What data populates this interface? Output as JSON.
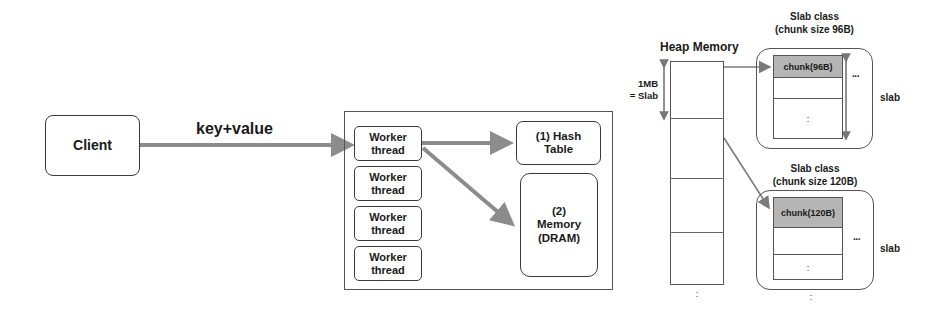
{
  "client": {
    "label": "Client"
  },
  "request_arrow": {
    "label": "key+value"
  },
  "server": {
    "workers": [
      {
        "line1": "Worker",
        "line2": "thread"
      },
      {
        "line1": "Worker",
        "line2": "thread"
      },
      {
        "line1": "Worker",
        "line2": "thread"
      },
      {
        "line1": "Worker",
        "line2": "thread"
      }
    ],
    "hash_table": {
      "line1": "(1) Hash",
      "line2": "Table"
    },
    "memory": {
      "line1": "(2)",
      "line2": "Memory",
      "line3": "(DRAM)"
    }
  },
  "heap": {
    "title": "Heap Memory",
    "slab_size_label": {
      "line1": "1MB",
      "line2": "= Slab"
    },
    "continuation": ":"
  },
  "slab_classes": [
    {
      "title_line1": "Slab class",
      "title_line2": "(chunk size 96B)",
      "chunk_label": "chunk(96B)",
      "more": "···",
      "slab_label": "slab",
      "vdots": ":"
    },
    {
      "title_line1": "Slab class",
      "title_line2": "(chunk size 120B)",
      "chunk_label": "chunk(120B)",
      "more": "···",
      "slab_label": "slab",
      "vdots": ":",
      "continuation": ":"
    }
  ],
  "colors": {
    "arrow": "#8c8c8c",
    "line": "#3a3a3a",
    "chunk_fill": "#b5b5b5"
  }
}
